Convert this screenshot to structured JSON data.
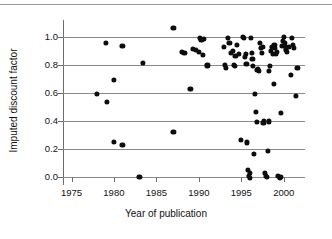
{
  "chart_data": {
    "type": "scatter",
    "title": "",
    "xlabel": "Year of publication",
    "ylabel": "Imputed discount factor",
    "xlim": [
      1974.0,
      2002.5
    ],
    "ylim": [
      -0.06,
      1.12
    ],
    "xticks": [
      1975,
      1980,
      1985,
      1990,
      1995,
      2000
    ],
    "xtick_labels": [
      "1975",
      "1980",
      "1985",
      "1990",
      "1995",
      "2000"
    ],
    "yticks": [
      0.0,
      0.2,
      0.4,
      0.6,
      0.8,
      1.0
    ],
    "ytick_labels": [
      "0.0",
      "0.2",
      "0.4",
      "0.6",
      "0.8",
      "1.0"
    ],
    "grid": "horizontal gridlines at each y tick, extending across plot",
    "legend": "none",
    "marker": "filled black circle",
    "marker_color": "#0d0d0d",
    "gridline_color": "#8a8a8a",
    "axis_color": "#6d6d6d",
    "background": "#ffffff",
    "n_points": 96,
    "points": [
      [
        1978.0,
        0.59
      ],
      [
        1979.0,
        0.955
      ],
      [
        1979.2,
        0.535
      ],
      [
        1980.0,
        0.69
      ],
      [
        1980.0,
        0.25
      ],
      [
        1981.0,
        0.935
      ],
      [
        1981.0,
        0.225
      ],
      [
        1983.0,
        -0.005
      ],
      [
        1983.4,
        0.815
      ],
      [
        1987.0,
        1.065
      ],
      [
        1987.0,
        0.32
      ],
      [
        1988.0,
        0.89
      ],
      [
        1988.3,
        0.885
      ],
      [
        1989.0,
        0.625
      ],
      [
        1989.3,
        0.915
      ],
      [
        1989.6,
        0.905
      ],
      [
        1990.0,
        0.89
      ],
      [
        1990.1,
        0.995
      ],
      [
        1990.2,
        0.985
      ],
      [
        1990.3,
        0.975
      ],
      [
        1990.5,
        0.87
      ],
      [
        1990.6,
        0.985
      ],
      [
        1991.0,
        0.795
      ],
      [
        1993.0,
        0.925
      ],
      [
        1993.1,
        0.8
      ],
      [
        1993.2,
        0.78
      ],
      [
        1993.4,
        0.995
      ],
      [
        1993.6,
        0.955
      ],
      [
        1993.8,
        0.885
      ],
      [
        1994.0,
        0.9
      ],
      [
        1994.1,
        0.8
      ],
      [
        1994.2,
        0.79
      ],
      [
        1994.3,
        0.865
      ],
      [
        1994.5,
        0.945
      ],
      [
        1994.7,
        0.88
      ],
      [
        1995.0,
        0.265
      ],
      [
        1995.2,
        1.0
      ],
      [
        1995.3,
        0.995
      ],
      [
        1995.4,
        0.855
      ],
      [
        1995.5,
        0.875
      ],
      [
        1995.6,
        0.805
      ],
      [
        1995.7,
        0.245
      ],
      [
        1995.8,
        0.045
      ],
      [
        1995.9,
        0.005
      ],
      [
        1996.0,
        0.025
      ],
      [
        1996.0,
        -0.01
      ],
      [
        1996.1,
        0.995
      ],
      [
        1996.2,
        0.885
      ],
      [
        1996.3,
        0.845
      ],
      [
        1996.4,
        0.79
      ],
      [
        1996.5,
        0.16
      ],
      [
        1996.6,
        0.59
      ],
      [
        1996.7,
        0.465
      ],
      [
        1996.8,
        0.39
      ],
      [
        1996.9,
        0.76
      ],
      [
        1997.0,
        0.77
      ],
      [
        1997.1,
        0.755
      ],
      [
        1997.2,
        0.955
      ],
      [
        1997.3,
        0.92
      ],
      [
        1997.4,
        0.885
      ],
      [
        1997.5,
        0.925
      ],
      [
        1997.6,
        0.385
      ],
      [
        1997.7,
        0.4
      ],
      [
        1997.8,
        0.025
      ],
      [
        1997.9,
        0.005
      ],
      [
        1998.0,
        0.0
      ],
      [
        1998.1,
        0.185
      ],
      [
        1998.2,
        0.395
      ],
      [
        1998.3,
        0.755
      ],
      [
        1998.4,
        0.79
      ],
      [
        1998.5,
        0.9
      ],
      [
        1998.6,
        0.925
      ],
      [
        1998.7,
        0.875
      ],
      [
        1998.8,
        0.66
      ],
      [
        1998.9,
        0.94
      ],
      [
        1999.0,
        0.92
      ],
      [
        1999.1,
        0.88
      ],
      [
        1999.2,
        0.89
      ],
      [
        1999.3,
        0.005
      ],
      [
        1999.5,
        -0.01
      ],
      [
        1999.6,
        0.0
      ],
      [
        1999.7,
        0.455
      ],
      [
        1999.8,
        0.935
      ],
      [
        1999.9,
        0.97
      ],
      [
        2000.0,
        1.0
      ],
      [
        2000.1,
        0.955
      ],
      [
        2000.2,
        0.925
      ],
      [
        2000.3,
        0.91
      ],
      [
        2000.4,
        0.89
      ],
      [
        2000.6,
        0.93
      ],
      [
        2000.8,
        0.73
      ],
      [
        2001.0,
        0.995
      ],
      [
        2001.1,
        0.94
      ],
      [
        2001.2,
        0.92
      ],
      [
        2001.4,
        0.58
      ],
      [
        2001.6,
        0.775
      ]
    ]
  },
  "axis_titles": {
    "x": "Year of publication",
    "y": "Imputed discount factor"
  }
}
